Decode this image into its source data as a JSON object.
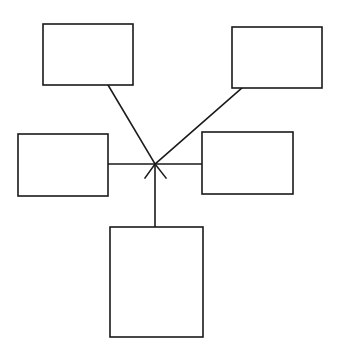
{
  "diagram": {
    "type": "star-topology",
    "canvas": {
      "width": 342,
      "height": 359,
      "background": "#ffffff",
      "stroke": "#1a1a1a"
    },
    "hub": {
      "x": 155,
      "y": 164
    },
    "nodes": [
      {
        "id": "top-left",
        "label": "",
        "x": 43,
        "y": 24,
        "w": 90,
        "h": 61
      },
      {
        "id": "top-right",
        "label": "",
        "x": 232,
        "y": 27,
        "w": 90,
        "h": 61
      },
      {
        "id": "middle-left",
        "label": "",
        "x": 18,
        "y": 134,
        "w": 90,
        "h": 62
      },
      {
        "id": "middle-right",
        "label": "",
        "x": 202,
        "y": 132,
        "w": 91,
        "h": 62
      },
      {
        "id": "bottom",
        "label": "",
        "x": 110,
        "y": 227,
        "w": 93,
        "h": 110
      }
    ],
    "edges": [
      {
        "from": "top-left",
        "x1": 108,
        "y1": 85,
        "x2": 155,
        "y2": 164
      },
      {
        "from": "top-right",
        "x1": 242,
        "y1": 88,
        "x2": 155,
        "y2": 164
      },
      {
        "from": "middle-left",
        "x1": 108,
        "y1": 164,
        "x2": 155,
        "y2": 164
      },
      {
        "from": "middle-right",
        "x1": 202,
        "y1": 164,
        "x2": 155,
        "y2": 164
      },
      {
        "from": "bottom",
        "x1": 155,
        "y1": 227,
        "x2": 155,
        "y2": 164
      }
    ],
    "crossing_tails": [
      {
        "x1": 155,
        "y1": 164,
        "x2": 145,
        "y2": 178
      },
      {
        "x1": 155,
        "y1": 164,
        "x2": 166,
        "y2": 178
      }
    ]
  }
}
